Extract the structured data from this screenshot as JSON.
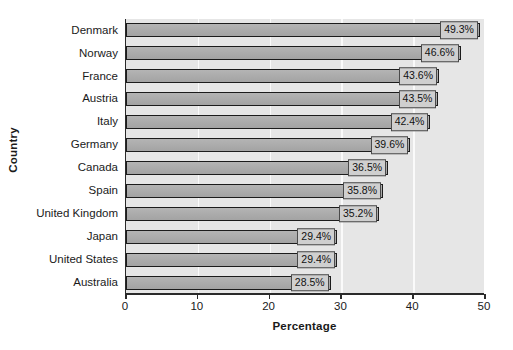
{
  "chart_data": {
    "type": "bar",
    "orientation": "horizontal",
    "title": "",
    "xlabel": "Percentage",
    "ylabel": "Country",
    "xlim": [
      0,
      50
    ],
    "ylim": null,
    "grid": true,
    "legend": null,
    "xticks": [
      "0",
      "10",
      "20",
      "30",
      "40",
      "50"
    ],
    "xtick_values": [
      0,
      10,
      20,
      30,
      40,
      50
    ],
    "categories": [
      "Denmark",
      "Norway",
      "France",
      "Austria",
      "Italy",
      "Germany",
      "Canada",
      "Spain",
      "United Kingdom",
      "Japan",
      "United States",
      "Australia"
    ],
    "values": [
      49.3,
      46.6,
      43.6,
      43.5,
      42.4,
      39.6,
      36.5,
      35.8,
      35.2,
      29.4,
      29.4,
      28.5
    ],
    "data_labels": [
      "49.3%",
      "46.6%",
      "43.6%",
      "43.5%",
      "42.4%",
      "39.6%",
      "36.5%",
      "35.8%",
      "35.2%",
      "29.4%",
      "29.4%",
      "28.5%"
    ],
    "colors": {
      "bar_fill": "#a8a8a8",
      "bar_border": "#1c1c1c",
      "plot_background": "#e6e6e6",
      "gridline": "#fafafa",
      "axis": "#2a2a2a",
      "label_box_fill": "#cfcfcf",
      "label_box_border": "#4a4a4a",
      "page_background": "#ffffff",
      "text": "#1a1a1a"
    }
  }
}
